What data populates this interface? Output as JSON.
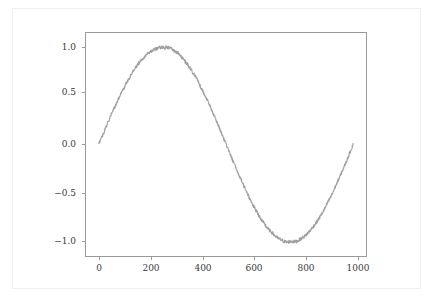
{
  "figure": {
    "background_color": "#ffffff",
    "border_color": "#f0f0f0",
    "axes_edge_color": "#9a9a9a",
    "tick_label_color": "#3a3a3a"
  },
  "chart_data": {
    "type": "line",
    "title": "",
    "subtitle": "",
    "xlabel": "",
    "ylabel": "",
    "legend": [],
    "legend_position": "none",
    "grid": false,
    "xlim": [
      -50,
      1050
    ],
    "ylim": [
      -1.15,
      1.15
    ],
    "xticks": [
      0,
      200,
      400,
      600,
      800,
      1000
    ],
    "xtick_labels": [
      "0",
      "200",
      "400",
      "600",
      "800",
      "1000"
    ],
    "yticks": [
      -1.0,
      -0.5,
      0.0,
      0.5,
      1.0
    ],
    "ytick_labels": [
      "−1.0",
      "−0.5",
      "0.0",
      "0.5",
      "1.0"
    ],
    "series": [
      {
        "name": "noisy sine",
        "color": "#a0a0a0",
        "linewidth": 1.1,
        "description": "sin(2*pi*x/1000) with small additive random noise",
        "x": [
          0,
          10,
          20,
          30,
          40,
          50,
          60,
          70,
          80,
          90,
          100,
          110,
          120,
          130,
          140,
          150,
          160,
          170,
          180,
          190,
          200,
          210,
          220,
          230,
          240,
          250,
          260,
          270,
          280,
          290,
          300,
          310,
          320,
          330,
          340,
          350,
          360,
          370,
          380,
          390,
          400,
          410,
          420,
          430,
          440,
          450,
          460,
          470,
          480,
          490,
          500,
          510,
          520,
          530,
          540,
          550,
          560,
          570,
          580,
          590,
          600,
          610,
          620,
          630,
          640,
          650,
          660,
          670,
          680,
          690,
          700,
          710,
          720,
          730,
          740,
          750,
          760,
          770,
          780,
          790,
          800,
          810,
          820,
          830,
          840,
          850,
          860,
          870,
          880,
          890,
          900,
          910,
          920,
          930,
          940,
          950,
          960,
          970,
          980,
          990,
          1000
        ],
        "y": [
          0.005,
          0.068,
          0.122,
          0.196,
          0.243,
          0.318,
          0.372,
          0.428,
          0.484,
          0.548,
          0.583,
          0.642,
          0.687,
          0.733,
          0.778,
          0.816,
          0.847,
          0.884,
          0.906,
          0.935,
          0.955,
          0.969,
          0.982,
          0.991,
          1.002,
          1.004,
          0.998,
          1.003,
          0.994,
          0.982,
          0.956,
          0.947,
          0.915,
          0.892,
          0.855,
          0.824,
          0.785,
          0.742,
          0.702,
          0.656,
          0.594,
          0.548,
          0.491,
          0.439,
          0.378,
          0.322,
          0.254,
          0.196,
          0.132,
          0.067,
          0.006,
          -0.062,
          -0.122,
          -0.188,
          -0.249,
          -0.311,
          -0.365,
          -0.429,
          -0.481,
          -0.539,
          -0.592,
          -0.645,
          -0.688,
          -0.736,
          -0.779,
          -0.818,
          -0.852,
          -0.884,
          -0.908,
          -0.934,
          -0.958,
          -0.975,
          -0.988,
          -1.002,
          -1.006,
          -1.003,
          -0.998,
          -1.004,
          -0.996,
          -0.981,
          -0.961,
          -0.945,
          -0.918,
          -0.889,
          -0.855,
          -0.823,
          -0.785,
          -0.742,
          -0.698,
          -0.652,
          -0.596,
          -0.548,
          -0.494,
          -0.432,
          -0.372,
          -0.318,
          -0.252,
          -0.194,
          -0.128,
          -0.062,
          0.008
        ]
      }
    ]
  },
  "axes_geometry": {
    "left_px": 85,
    "top_px": 32,
    "width_px": 282,
    "height_px": 225
  }
}
